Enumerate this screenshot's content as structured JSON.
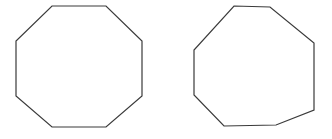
{
  "canvas": {
    "width": 332,
    "height": 139,
    "background_color": "#ffffff"
  },
  "style": {
    "stroke_color": "#3a3a3a",
    "stroke_width": 1.2,
    "fill": "none"
  },
  "shapes": [
    {
      "name": "regular-octagon",
      "label": "Left octagon",
      "sides": 8,
      "regular": true,
      "points": "52,6 106,6 142,41 142,96 106,127 52,127 16,96 16,41"
    },
    {
      "name": "irregular-octagon",
      "label": "Right octagon",
      "sides": 8,
      "regular": false,
      "points": "234,6 270,7 314,43 314,110 276,125 224,126 194,95 194,50"
    }
  ]
}
